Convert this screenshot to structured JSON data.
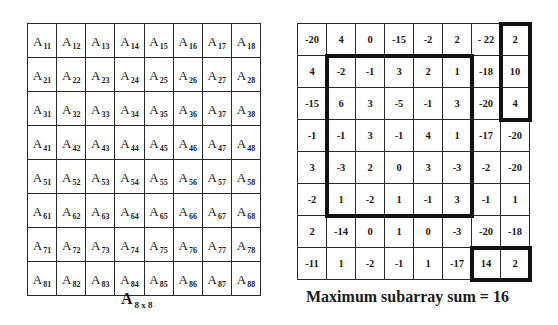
{
  "left_matrix": {
    "symbol": "A",
    "rows": [
      [
        "11",
        "12",
        "13",
        "14",
        "15",
        "16",
        "17",
        "18"
      ],
      [
        "21",
        "22",
        "23",
        "24",
        "25",
        "26",
        "27",
        "28"
      ],
      [
        "31",
        "32",
        "33",
        "34",
        "35",
        "36",
        "37",
        "38"
      ],
      [
        "41",
        "42",
        "43",
        "44",
        "45",
        "46",
        "47",
        "48"
      ],
      [
        "51",
        "52",
        "53",
        "54",
        "55",
        "56",
        "57",
        "58"
      ],
      [
        "61",
        "62",
        "63",
        "64",
        "65",
        "66",
        "67",
        "68"
      ],
      [
        "71",
        "72",
        "73",
        "74",
        "75",
        "76",
        "77",
        "78"
      ],
      [
        "81",
        "82",
        "83",
        "84",
        "85",
        "86",
        "87",
        "88"
      ]
    ],
    "caption": {
      "symbol": "A",
      "subscript": "8 x 8"
    }
  },
  "right_matrix": {
    "rows": [
      [
        "-20",
        "4",
        "0",
        "-15",
        "-2",
        "2",
        "- 22",
        "2"
      ],
      [
        "4",
        "-2",
        "-1",
        "3",
        "2",
        "1",
        "-18",
        "10"
      ],
      [
        "-15",
        "6",
        "3",
        "-5",
        "-1",
        "3",
        "-20",
        "4"
      ],
      [
        "-1",
        "-1",
        "3",
        "-1",
        "4",
        "1",
        "-17",
        "-20"
      ],
      [
        "3",
        "-3",
        "2",
        "0",
        "3",
        "-3",
        "-2",
        "-20"
      ],
      [
        "-2",
        "1",
        "-2",
        "1",
        "-1",
        "3",
        "-1",
        "1"
      ],
      [
        "2",
        "-14",
        "0",
        "1",
        "0",
        "-3",
        "-20",
        "-18"
      ],
      [
        "-11",
        "1",
        "-2",
        "-1",
        "1",
        "-17",
        "14",
        "2"
      ]
    ],
    "highlighted_subarrays": [
      {
        "name": "center-block",
        "row_start": 1,
        "row_end": 5,
        "col_start": 1,
        "col_end": 5,
        "sum": 16
      },
      {
        "name": "top-right-column",
        "row_start": 0,
        "row_end": 2,
        "col_start": 7,
        "col_end": 7,
        "sum": 16
      },
      {
        "name": "bottom-right-pair",
        "row_start": 7,
        "row_end": 7,
        "col_start": 6,
        "col_end": 7,
        "sum": 16
      }
    ],
    "caption": "Maximum subarray sum = 16"
  }
}
